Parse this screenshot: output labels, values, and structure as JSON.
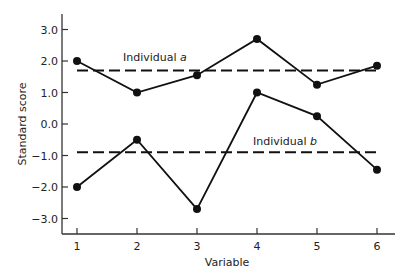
{
  "chart_data": {
    "type": "line",
    "title": "",
    "xlabel": "Variable",
    "ylabel": "Standard score",
    "x": [
      1,
      2,
      3,
      4,
      5,
      6
    ],
    "categories": [
      "1",
      "2",
      "3",
      "4",
      "5",
      "6"
    ],
    "yticks": [
      "3.0",
      "2.0",
      "1.0",
      "0.0",
      "-1.0",
      "-2.0",
      "-3.0"
    ],
    "ylim": [
      -3.5,
      3.5
    ],
    "grid": false,
    "legend": "none (inline annotations)",
    "series": [
      {
        "name": "Individual a",
        "values": [
          2.0,
          1.0,
          1.55,
          2.7,
          1.25,
          1.85
        ],
        "mean_line": 1.7
      },
      {
        "name": "Individual b",
        "values": [
          -2.0,
          -0.5,
          -2.7,
          1.0,
          0.25,
          -1.45
        ],
        "mean_line": -0.9
      }
    ],
    "annotations": [
      {
        "text": "Individual",
        "italic": "a",
        "near": "dashed line a"
      },
      {
        "text": "Individual",
        "italic": "b",
        "near": "dashed line b"
      }
    ]
  },
  "colors": {
    "line": "#111111",
    "axis": "#333333",
    "background": "#ffffff"
  }
}
